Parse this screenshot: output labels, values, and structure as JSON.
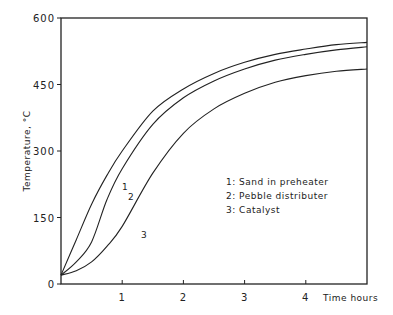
{
  "chart_data": {
    "type": "line",
    "title": "",
    "xlabel": "Time hours",
    "ylabel": "Temperature, °C",
    "xlim": [
      0,
      5
    ],
    "ylim": [
      0,
      600
    ],
    "xticks": [
      "1",
      "2",
      "3",
      "4"
    ],
    "yticks": [
      "0",
      "150",
      "300",
      "450",
      "600"
    ],
    "grid": false,
    "x": [
      0,
      0.25,
      0.5,
      0.75,
      1,
      1.5,
      2,
      2.5,
      3,
      3.5,
      4,
      4.5,
      5
    ],
    "series": [
      {
        "name": "1: Sand in preheater",
        "label": "1",
        "values": [
          20,
          100,
          180,
          245,
          300,
          390,
          440,
          475,
          500,
          518,
          530,
          540,
          545
        ]
      },
      {
        "name": "2: Pebble distributer",
        "label": "2",
        "values": [
          20,
          50,
          95,
          190,
          260,
          360,
          420,
          458,
          485,
          505,
          518,
          528,
          535
        ]
      },
      {
        "name": "3: Catalyst",
        "label": "3",
        "values": [
          20,
          30,
          50,
          85,
          130,
          250,
          340,
          395,
          430,
          455,
          470,
          480,
          485
        ]
      }
    ],
    "legend": [
      "1: Sand in preheater",
      "2: Pebble distributer",
      "3: Catalyst"
    ],
    "legend_position": "inside-right"
  }
}
